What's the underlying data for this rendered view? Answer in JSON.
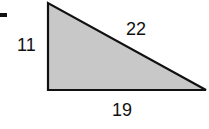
{
  "diagram": {
    "type": "right-triangle",
    "fill_color": "#c8c8c8",
    "stroke_color": "#111111",
    "sides": {
      "vertical_leg": "11",
      "hypotenuse": "22",
      "horizontal_leg": "19"
    }
  }
}
